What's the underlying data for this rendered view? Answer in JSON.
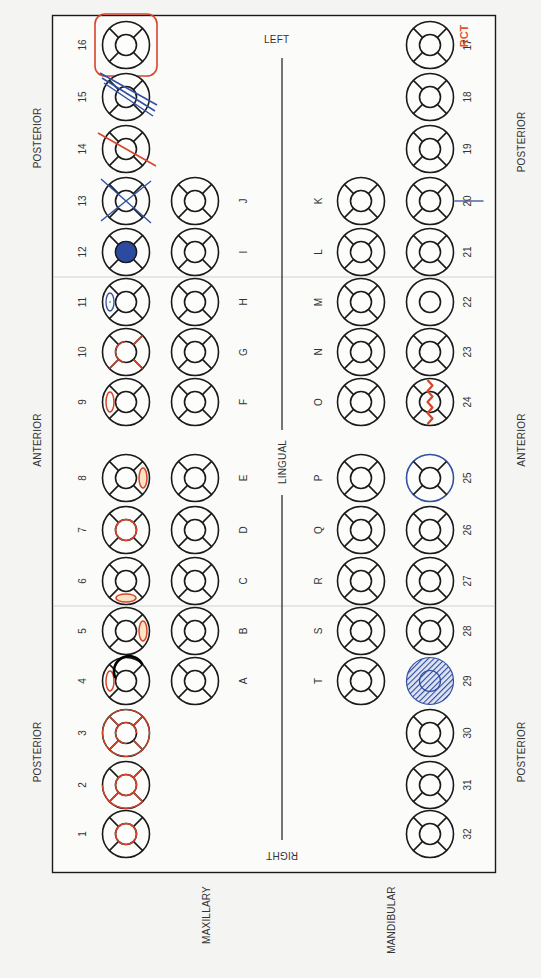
{
  "colors": {
    "outline": "#1a1a1a",
    "red_mark": "#d8452a",
    "orange_fill": "#f2a03a",
    "blue_mark": "#3150a0",
    "blue_fill": "#2c4aa0",
    "divider": "#c8c8c8",
    "background": "#f4f4f2",
    "rct_label": "#e0532a"
  },
  "side_labels": {
    "left": "LEFT",
    "right": "RIGHT",
    "lingual": "LINGUAL",
    "maxillary": "MAXILLARY",
    "mandibular": "MANDIBULAR",
    "top_posterior": "POSTERIOR",
    "top_anterior": "ANTERIOR",
    "top_posterior_2": "POSTERIOR",
    "bottom_posterior": "POSTERIOR",
    "bottom_anterior": "ANTERIOR",
    "bottom_posterior_2": "POSTERIOR"
  },
  "annotation": {
    "rct": "RCT"
  },
  "upper_permanent": [
    {
      "num": "16",
      "y": 45,
      "mark": "box"
    },
    {
      "num": "15",
      "y": 97,
      "mark": "double-strike-blue"
    },
    {
      "num": "14",
      "y": 149,
      "mark": "strike-red"
    },
    {
      "num": "13",
      "y": 201,
      "mark": "x-blue"
    },
    {
      "num": "12",
      "y": 252,
      "mark": "occlusal-fill-blue"
    },
    {
      "num": "11",
      "y": 302,
      "mark": "facial-oval-blue"
    },
    {
      "num": "10",
      "y": 352,
      "mark": "lines-red-lower"
    },
    {
      "num": "9",
      "y": 402,
      "mark": "facial-oval-red"
    },
    {
      "num": "8",
      "y": 478,
      "mark": "lingual-oval-red"
    },
    {
      "num": "7",
      "y": 530,
      "mark": "occlusal-ring-red"
    },
    {
      "num": "6",
      "y": 581,
      "mark": "distal-oval-red"
    },
    {
      "num": "5",
      "y": 631,
      "mark": "lingual-oval-red"
    },
    {
      "num": "4",
      "y": 681,
      "mark": "facial-oval-red"
    },
    {
      "num": "3",
      "y": 733,
      "mark": "crown-red"
    },
    {
      "num": "2",
      "y": 785,
      "mark": "crown-partial-red"
    },
    {
      "num": "1",
      "y": 834,
      "mark": "occlusal-ring-red"
    }
  ],
  "upper_primary": [
    {
      "letter": "J",
      "y": 201
    },
    {
      "letter": "I",
      "y": 252
    },
    {
      "letter": "H",
      "y": 302
    },
    {
      "letter": "G",
      "y": 352
    },
    {
      "letter": "F",
      "y": 402
    },
    {
      "letter": "E",
      "y": 478
    },
    {
      "letter": "D",
      "y": 530
    },
    {
      "letter": "C",
      "y": 581
    },
    {
      "letter": "B",
      "y": 631
    },
    {
      "letter": "A",
      "y": 681
    }
  ],
  "lower_primary": [
    {
      "letter": "K",
      "y": 201
    },
    {
      "letter": "L",
      "y": 252
    },
    {
      "letter": "M",
      "y": 302
    },
    {
      "letter": "N",
      "y": 352
    },
    {
      "letter": "O",
      "y": 402
    },
    {
      "letter": "P",
      "y": 478
    },
    {
      "letter": "Q",
      "y": 530
    },
    {
      "letter": "R",
      "y": 581
    },
    {
      "letter": "S",
      "y": 631
    },
    {
      "letter": "T",
      "y": 681
    }
  ],
  "lower_permanent": [
    {
      "num": "17",
      "y": 45,
      "mark": "none"
    },
    {
      "num": "18",
      "y": 97,
      "mark": "none"
    },
    {
      "num": "19",
      "y": 149,
      "mark": "none"
    },
    {
      "num": "20",
      "y": 201,
      "mark": "root-line-blue"
    },
    {
      "num": "21",
      "y": 252,
      "mark": "none"
    },
    {
      "num": "22",
      "y": 302,
      "mark": "plain-no-lines"
    },
    {
      "num": "23",
      "y": 352,
      "mark": "none"
    },
    {
      "num": "24",
      "y": 402,
      "mark": "zigzag-red"
    },
    {
      "num": "25",
      "y": 478,
      "mark": "outline-blue"
    },
    {
      "num": "26",
      "y": 530,
      "mark": "none"
    },
    {
      "num": "27",
      "y": 581,
      "mark": "none"
    },
    {
      "num": "28",
      "y": 631,
      "mark": "none"
    },
    {
      "num": "29",
      "y": 681,
      "mark": "hatched-blue"
    },
    {
      "num": "30",
      "y": 733,
      "mark": "none"
    },
    {
      "num": "31",
      "y": 785,
      "mark": "none"
    },
    {
      "num": "32",
      "y": 834,
      "mark": "none"
    }
  ]
}
